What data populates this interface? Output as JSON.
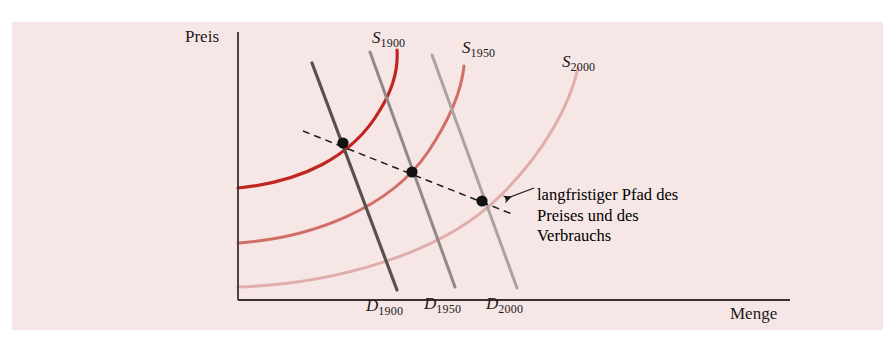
{
  "figure": {
    "background_color": "#f6e6e5",
    "page_color": "#ffffff",
    "axis_color": "#3c3235"
  },
  "axes": {
    "y_label": "Preis",
    "x_label": "Menge",
    "origin_x": 238,
    "origin_y": 300,
    "y_top": 32,
    "x_right": 790
  },
  "annotation": {
    "line1": "langfristiger Pfad des",
    "line2": "Preises und des",
    "line3": "Verbrauchs"
  },
  "supply_curves": [
    {
      "name": "S",
      "year": "1900",
      "label_x": 372,
      "label_y": 28,
      "color": "#c0261f",
      "width": 3.2,
      "path": "M 238,188 C 300,182 352,158 380,110 C 396,84 398,64 397,50"
    },
    {
      "name": "S",
      "year": "1950",
      "label_x": 462,
      "label_y": 38,
      "color": "#cf6f68",
      "width": 3.0,
      "path": "M 238,243 C 312,238 390,208 428,152 C 452,116 462,86 464,66"
    },
    {
      "name": "S",
      "year": "2000",
      "label_x": 562,
      "label_y": 52,
      "color": "#e0aeaa",
      "width": 3.0,
      "path": "M 238,287 C 330,284 440,256 500,196 C 545,152 570,104 578,68"
    }
  ],
  "demand_curves": [
    {
      "name": "D",
      "year": "1900",
      "label_x": 366,
      "label_y": 296,
      "color": "#57514f",
      "width": 3.2,
      "x1": 312,
      "y1": 63,
      "x2": 397,
      "y2": 290
    },
    {
      "name": "D",
      "year": "1950",
      "label_x": 424,
      "label_y": 294,
      "color": "#8f8a88",
      "width": 3.0,
      "x1": 370,
      "y1": 52,
      "x2": 455,
      "y2": 287
    },
    {
      "name": "D",
      "year": "2000",
      "label_x": 486,
      "label_y": 294,
      "color": "#a9a4a2",
      "width": 3.0,
      "x1": 432,
      "y1": 55,
      "x2": 517,
      "y2": 288
    }
  ],
  "equilibrium_points": [
    {
      "label": "equilibrium-1900",
      "x": 343,
      "y": 143,
      "r": 5.6
    },
    {
      "label": "equilibrium-1950",
      "x": 412,
      "y": 172,
      "r": 5.6
    },
    {
      "label": "equilibrium-2000",
      "x": 482,
      "y": 201,
      "r": 5.6
    }
  ],
  "trend_line": {
    "color": "#1b1b1b",
    "dash": "7,5",
    "x1": 303,
    "y1": 131,
    "x2": 512,
    "y2": 214
  },
  "leader": {
    "color": "#1b1b1b",
    "from_x": 534,
    "from_y": 188,
    "to_x": 505,
    "to_y": 199
  },
  "chart_data": {
    "type": "line",
    "title": "",
    "xlabel": "Menge",
    "ylabel": "Preis",
    "series": [
      {
        "name": "S_1900",
        "kind": "supply",
        "color": "#c0261f"
      },
      {
        "name": "S_1950",
        "kind": "supply",
        "color": "#cf6f68"
      },
      {
        "name": "S_2000",
        "kind": "supply",
        "color": "#e0aeaa"
      },
      {
        "name": "D_1900",
        "kind": "demand",
        "color": "#57514f"
      },
      {
        "name": "D_1950",
        "kind": "demand",
        "color": "#8f8a88"
      },
      {
        "name": "D_2000",
        "kind": "demand",
        "color": "#a9a4a2"
      }
    ],
    "equilibria": [
      {
        "year": "1900",
        "quantity_px": 343,
        "price_px": 143
      },
      {
        "year": "1950",
        "quantity_px": 412,
        "price_px": 172
      },
      {
        "year": "2000",
        "quantity_px": 482,
        "price_px": 201
      }
    ],
    "annotations": [
      "langfristiger Pfad des Preises und des Verbrauchs"
    ],
    "grid": false,
    "legend": "inline-curve-labels"
  }
}
